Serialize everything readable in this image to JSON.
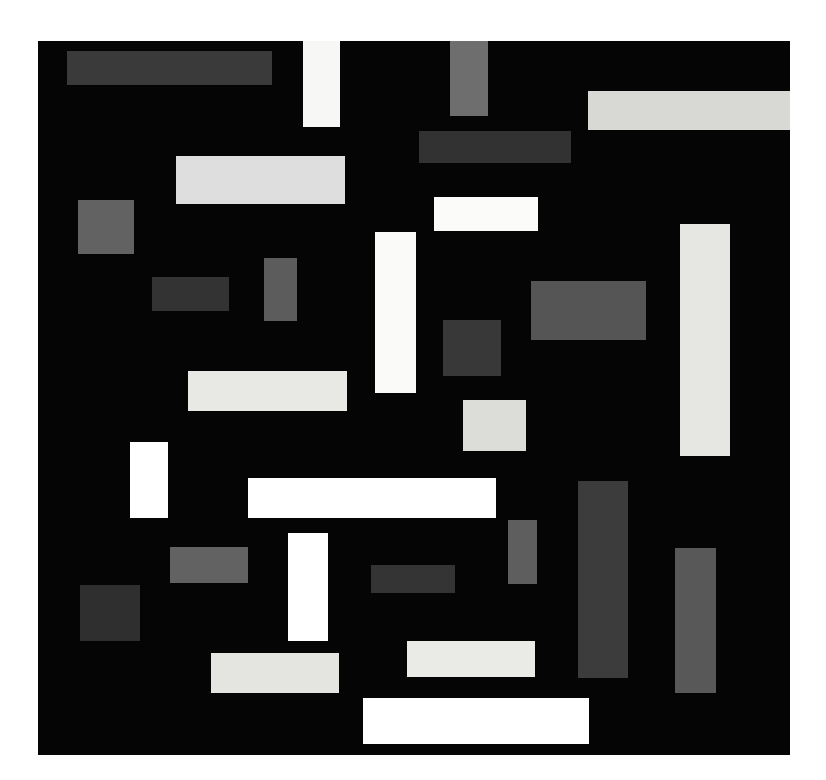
{
  "artwork": {
    "title": "Composition in Black, White and Grey",
    "style": "geometric-abstract",
    "image_width": 826,
    "image_height": 780,
    "background_color": "#ffffff",
    "canvas": {
      "x": 38,
      "y": 41,
      "width": 752,
      "height": 714,
      "ground_color": "#050505"
    },
    "palette": {
      "ground": "#050505",
      "white": "#ffffff",
      "off_white": "#f4f4f2",
      "light_grey": "#e2e2e0",
      "pale_grey": "#d2d2d0",
      "mid_grey": "#6e6e6e",
      "grey": "#5e5e5e",
      "dark_grey": "#3a3a3a",
      "darker_grey": "#2e2e2e"
    },
    "blocks": [
      {
        "id": "blk-01",
        "name": "dark-bar-top-left",
        "x": 67,
        "y": 51,
        "w": 205,
        "h": 34,
        "color": "#3a3a3a",
        "orientation": "horizontal"
      },
      {
        "id": "blk-02",
        "name": "white-column-top",
        "x": 303,
        "y": 41,
        "w": 37,
        "h": 86,
        "color": "#f7f7f5",
        "orientation": "vertical"
      },
      {
        "id": "blk-03",
        "name": "grey-column-top-centre",
        "x": 450,
        "y": 41,
        "w": 38,
        "h": 75,
        "color": "#6e6e6e",
        "orientation": "vertical"
      },
      {
        "id": "blk-04",
        "name": "pale-bar-top-right",
        "x": 588,
        "y": 91,
        "w": 203,
        "h": 39,
        "color": "#d8d8d4",
        "orientation": "horizontal"
      },
      {
        "id": "blk-05",
        "name": "dark-bar-upper-centre",
        "x": 419,
        "y": 131,
        "w": 152,
        "h": 32,
        "color": "#323232",
        "orientation": "horizontal"
      },
      {
        "id": "blk-06",
        "name": "pale-bar-upper-left",
        "x": 176,
        "y": 156,
        "w": 169,
        "h": 48,
        "color": "#dedede",
        "orientation": "horizontal"
      },
      {
        "id": "blk-07",
        "name": "grey-square-left",
        "x": 78,
        "y": 200,
        "w": 56,
        "h": 54,
        "color": "#626262",
        "orientation": "square"
      },
      {
        "id": "blk-08",
        "name": "white-bar-upper-centre",
        "x": 434,
        "y": 197,
        "w": 104,
        "h": 34,
        "color": "#fbfbf9",
        "orientation": "horizontal"
      },
      {
        "id": "blk-09",
        "name": "light-tall-column-right",
        "x": 680,
        "y": 224,
        "w": 50,
        "h": 232,
        "color": "#e6e6e3",
        "orientation": "vertical"
      },
      {
        "id": "blk-10",
        "name": "white-tall-column-centre",
        "x": 375,
        "y": 232,
        "w": 41,
        "h": 161,
        "color": "#fafaf8",
        "orientation": "vertical"
      },
      {
        "id": "blk-11",
        "name": "grey-column-small-left",
        "x": 264,
        "y": 258,
        "w": 33,
        "h": 63,
        "color": "#5c5c5c",
        "orientation": "vertical"
      },
      {
        "id": "blk-12",
        "name": "dark-bar-mid-left",
        "x": 152,
        "y": 277,
        "w": 77,
        "h": 34,
        "color": "#333333",
        "orientation": "horizontal"
      },
      {
        "id": "blk-13",
        "name": "grey-block-mid-right",
        "x": 531,
        "y": 281,
        "w": 115,
        "h": 59,
        "color": "#555555",
        "orientation": "horizontal"
      },
      {
        "id": "blk-14",
        "name": "dark-square-centre",
        "x": 443,
        "y": 320,
        "w": 58,
        "h": 56,
        "color": "#383838",
        "orientation": "square"
      },
      {
        "id": "blk-15",
        "name": "pale-bar-mid-left",
        "x": 188,
        "y": 371,
        "w": 159,
        "h": 40,
        "color": "#e8e8e5",
        "orientation": "horizontal"
      },
      {
        "id": "blk-16",
        "name": "pale-square-centre",
        "x": 463,
        "y": 400,
        "w": 63,
        "h": 51,
        "color": "#dcdcd9",
        "orientation": "square"
      },
      {
        "id": "blk-17",
        "name": "white-column-left",
        "x": 130,
        "y": 442,
        "w": 38,
        "h": 76,
        "color": "#ffffff",
        "orientation": "vertical"
      },
      {
        "id": "blk-18",
        "name": "white-long-bar-centre",
        "x": 248,
        "y": 478,
        "w": 248,
        "h": 40,
        "color": "#ffffff",
        "orientation": "horizontal"
      },
      {
        "id": "blk-19",
        "name": "dark-tall-column-right",
        "x": 578,
        "y": 481,
        "w": 50,
        "h": 197,
        "color": "#3c3c3c",
        "orientation": "vertical"
      },
      {
        "id": "blk-20",
        "name": "grey-column-lower-centre",
        "x": 508,
        "y": 520,
        "w": 29,
        "h": 64,
        "color": "#5e5e5e",
        "orientation": "vertical"
      },
      {
        "id": "blk-21",
        "name": "white-column-lower-left",
        "x": 288,
        "y": 533,
        "w": 40,
        "h": 108,
        "color": "#ffffff",
        "orientation": "vertical"
      },
      {
        "id": "blk-22",
        "name": "grey-bar-lower-left",
        "x": 170,
        "y": 547,
        "w": 78,
        "h": 36,
        "color": "#626262",
        "orientation": "horizontal"
      },
      {
        "id": "blk-23",
        "name": "grey-tall-column-far-right",
        "x": 675,
        "y": 548,
        "w": 41,
        "h": 145,
        "color": "#585858",
        "orientation": "vertical"
      },
      {
        "id": "blk-24",
        "name": "dark-bar-lower-centre",
        "x": 371,
        "y": 565,
        "w": 84,
        "h": 28,
        "color": "#343434",
        "orientation": "horizontal"
      },
      {
        "id": "blk-25",
        "name": "dark-square-lower-left",
        "x": 80,
        "y": 585,
        "w": 60,
        "h": 56,
        "color": "#2f2f2f",
        "orientation": "square"
      },
      {
        "id": "blk-26",
        "name": "pale-bar-bottom-left",
        "x": 211,
        "y": 653,
        "w": 128,
        "h": 40,
        "color": "#e4e4e1",
        "orientation": "horizontal"
      },
      {
        "id": "blk-27",
        "name": "pale-bar-bottom-centre",
        "x": 407,
        "y": 641,
        "w": 128,
        "h": 36,
        "color": "#eaeae7",
        "orientation": "horizontal"
      },
      {
        "id": "blk-28",
        "name": "white-bar-bottom",
        "x": 363,
        "y": 698,
        "w": 226,
        "h": 46,
        "color": "#ffffff",
        "orientation": "horizontal"
      }
    ]
  }
}
